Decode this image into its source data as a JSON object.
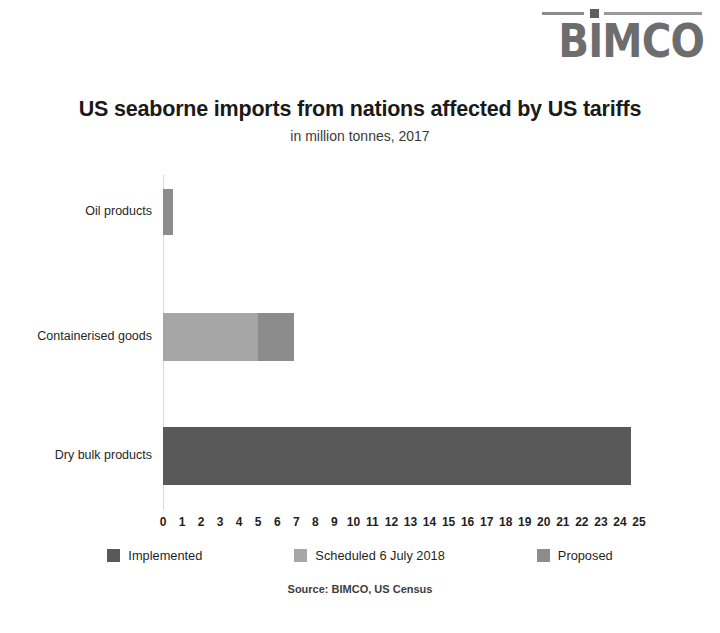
{
  "logo": {
    "name": "BIMCO",
    "text": "BIMCO"
  },
  "header": {
    "title": "US seaborne imports from nations affected by US tariffs",
    "subtitle": "in million tonnes, 2017"
  },
  "source": "Source: BIMCO, US Census",
  "colors": {
    "implemented": "#595959",
    "scheduled": "#a6a6a6",
    "proposed": "#8c8c8c",
    "axis": "#d9d9d9",
    "background": "#ffffff",
    "text": "#1f1f1f"
  },
  "chart_data": {
    "type": "bar",
    "orientation": "horizontal",
    "stacked": true,
    "title": "US seaborne imports from nations affected by US tariffs",
    "subtitle": "in million tonnes, 2017",
    "xlabel": "",
    "ylabel": "",
    "xlim": [
      0,
      25
    ],
    "xticks": [
      0,
      1,
      2,
      3,
      4,
      5,
      6,
      7,
      8,
      9,
      10,
      11,
      12,
      13,
      14,
      15,
      16,
      17,
      18,
      19,
      20,
      21,
      22,
      23,
      24,
      25
    ],
    "grid": false,
    "legend_position": "bottom",
    "units": "million tonnes",
    "categories": [
      "Oil products",
      "Containerised goods",
      "Dry bulk products"
    ],
    "series": [
      {
        "name": "Implemented",
        "color": "#595959",
        "values": [
          0,
          0,
          24.6
        ]
      },
      {
        "name": "Scheduled 6 July 2018",
        "color": "#a6a6a6",
        "values": [
          0,
          5.0,
          0
        ]
      },
      {
        "name": "Proposed",
        "color": "#8c8c8c",
        "values": [
          0.5,
          1.9,
          0
        ]
      }
    ],
    "totals": [
      0.5,
      6.9,
      24.6
    ]
  },
  "legend": [
    {
      "label": "Implemented",
      "color": "#595959"
    },
    {
      "label": "Scheduled 6 July 2018",
      "color": "#a6a6a6"
    },
    {
      "label": "Proposed",
      "color": "#8c8c8c"
    }
  ]
}
